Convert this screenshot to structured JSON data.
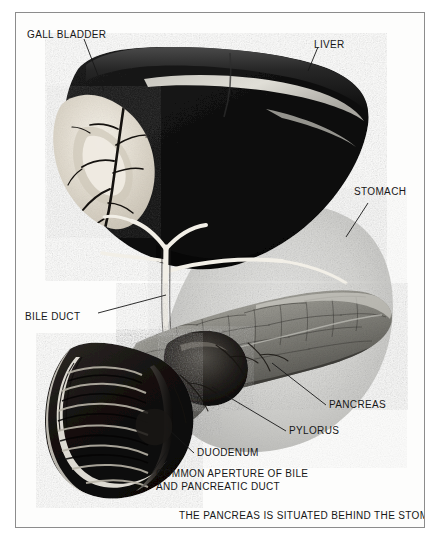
{
  "figure": {
    "caption": "THE PANCREAS IS SITUATED BEHIND THE STOMACH",
    "frame_color": "#8c8c8c",
    "background_color": "#fdfdfc",
    "ink_color": "#171717"
  },
  "labels": {
    "gall_bladder": "GALL BLADDER",
    "liver": "LIVER",
    "stomach": "STOMACH",
    "bile_duct": "BILE DUCT",
    "pancreas": "PANCREAS",
    "pylorus": "PYLORUS",
    "duodenum": "DUODENUM",
    "common_aperture_line1": "COMMON APERTURE OF BILE",
    "common_aperture_line2": "AND PANCREATIC DUCT"
  },
  "structures": {
    "liver": {
      "name": "liver",
      "tone": "#121212"
    },
    "gall_bladder": {
      "name": "gall-bladder",
      "tone": "#ece7dd"
    },
    "stomach": {
      "name": "stomach-silhouette",
      "tone": "#cdcdcb"
    },
    "pancreas": {
      "name": "pancreas",
      "tone": "#8d8d8a"
    },
    "duodenum": {
      "name": "duodenum",
      "tone": "#15110f"
    },
    "bile_duct": {
      "name": "bile-duct",
      "tone": "#f4f2ec"
    }
  }
}
